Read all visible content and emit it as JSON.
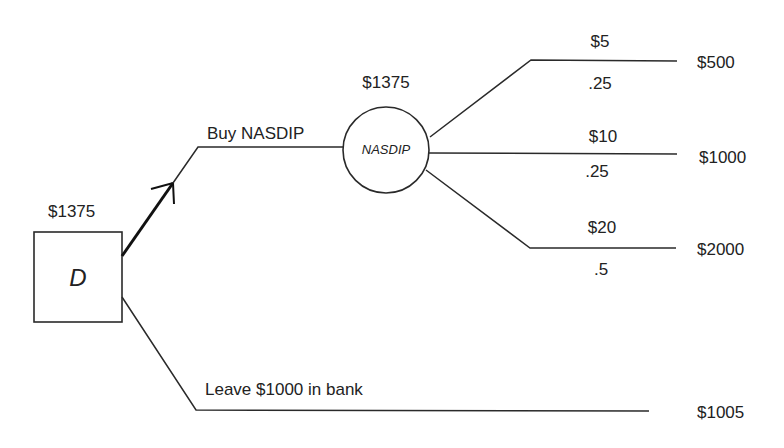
{
  "diagram": {
    "type": "decision-tree",
    "decision_node": {
      "label": "D",
      "value": "$1375"
    },
    "branches": [
      {
        "label": "Buy NASDIP",
        "chosen": true,
        "chance_node": {
          "label": "NASDIP",
          "value": "$1375",
          "outcomes": [
            {
              "price": "$5",
              "probability": ".25",
              "payoff": "$500"
            },
            {
              "price": "$10",
              "probability": ".25",
              "payoff": "$1000"
            },
            {
              "price": "$20",
              "probability": ".5",
              "payoff": "$2000"
            }
          ]
        }
      },
      {
        "label": "Leave $1000 in bank",
        "chosen": false,
        "payoff": "$1005"
      }
    ]
  },
  "colors": {
    "line": "#2a2a2a",
    "text": "#222222",
    "background": "#ffffff"
  }
}
